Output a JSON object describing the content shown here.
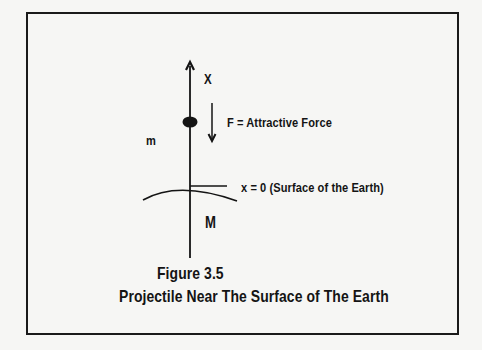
{
  "figure": {
    "axis_label": "X",
    "force_label": "F = Attractive Force",
    "mass_label": "m",
    "surface_label": "x = 0  (Surface of the Earth)",
    "earth_mass_label": "M",
    "figure_number": "Figure 3.5",
    "caption": "Projectile Near The Surface of The Earth"
  },
  "colors": {
    "background": "#f6f6f4",
    "ink": "#141414"
  }
}
